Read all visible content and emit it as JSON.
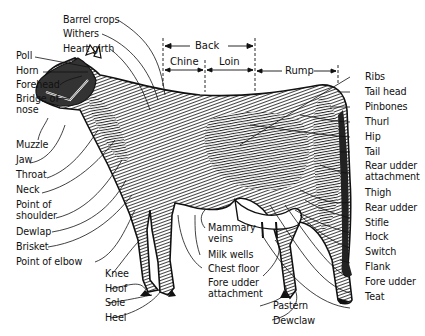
{
  "diagram": {
    "regions": {
      "back": "Back",
      "chine": "Chine",
      "loin": "Loin",
      "rump": "Rump"
    },
    "labels_top": [
      {
        "id": "barrel-crops",
        "text": "Barrel crops"
      },
      {
        "id": "withers",
        "text": "Withers"
      },
      {
        "id": "heart-girth",
        "text": "Heart girth"
      }
    ],
    "labels_left": [
      {
        "id": "poll",
        "text": "Poll"
      },
      {
        "id": "horn",
        "text": "Horn"
      },
      {
        "id": "forehead",
        "text": "Forehead"
      },
      {
        "id": "bridge-of-nose",
        "text": "Bridge of\nnose"
      },
      {
        "id": "muzzle",
        "text": "Muzzle"
      },
      {
        "id": "jaw",
        "text": "Jaw"
      },
      {
        "id": "throat",
        "text": "Throat"
      },
      {
        "id": "neck",
        "text": "Neck"
      },
      {
        "id": "point-of-shoulder",
        "text": "Point of\nshoulder"
      },
      {
        "id": "dewlap",
        "text": "Dewlap"
      },
      {
        "id": "brisket",
        "text": "Brisket"
      },
      {
        "id": "point-of-elbow",
        "text": "Point of elbow"
      }
    ],
    "labels_right": [
      {
        "id": "ribs",
        "text": "Ribs"
      },
      {
        "id": "tail-head",
        "text": "Tail head"
      },
      {
        "id": "pinbones",
        "text": "Pinbones"
      },
      {
        "id": "thurl",
        "text": "Thurl"
      },
      {
        "id": "hip",
        "text": "Hip"
      },
      {
        "id": "tail",
        "text": "Tail"
      },
      {
        "id": "rear-udder-attachment",
        "text": "Rear udder\nattachment"
      },
      {
        "id": "thigh",
        "text": "Thigh"
      },
      {
        "id": "rear-udder",
        "text": "Rear udder"
      },
      {
        "id": "stifle",
        "text": "Stifle"
      },
      {
        "id": "hock",
        "text": "Hock"
      },
      {
        "id": "switch",
        "text": "Switch"
      },
      {
        "id": "flank",
        "text": "Flank"
      },
      {
        "id": "fore-udder",
        "text": "Fore udder"
      },
      {
        "id": "teat",
        "text": "Teat"
      }
    ],
    "labels_bottom_left": [
      {
        "id": "knee",
        "text": "Knee"
      },
      {
        "id": "hoof",
        "text": "Hoof"
      },
      {
        "id": "sole",
        "text": "Sole"
      },
      {
        "id": "heel",
        "text": "Heel"
      }
    ],
    "labels_bottom_center": [
      {
        "id": "mammary-veins",
        "text": "Mammary\nveins"
      },
      {
        "id": "milk-wells",
        "text": "Milk wells"
      },
      {
        "id": "chest-floor",
        "text": "Chest floor"
      },
      {
        "id": "fore-udder-attachment",
        "text": "Fore udder\nattachment"
      }
    ],
    "labels_bottom_right": [
      {
        "id": "pastern",
        "text": "Pastern"
      },
      {
        "id": "dewclaw",
        "text": "Dewclaw"
      }
    ]
  }
}
